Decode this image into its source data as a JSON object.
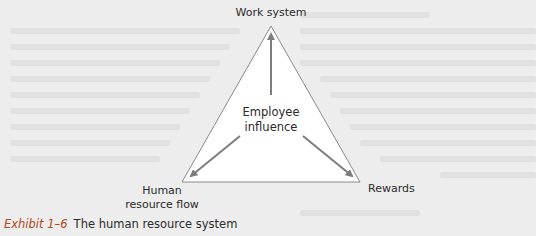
{
  "diagram": {
    "type": "triangle-influence",
    "nodes": {
      "top": {
        "label": "Work system"
      },
      "center": {
        "line1": "Employee",
        "line2": "influence"
      },
      "bottom_left": {
        "line1": "Human",
        "line2": "resource flow"
      },
      "bottom_right": {
        "label": "Rewards"
      }
    },
    "edges": [
      {
        "from": "Employee influence",
        "to": "Work system"
      },
      {
        "from": "Employee influence",
        "to": "Human resource flow"
      },
      {
        "from": "Employee influence",
        "to": "Rewards"
      }
    ],
    "colors": {
      "triangle_fill": "#ffffff",
      "triangle_stroke": "#8a8a8a",
      "arrow": "#7d7d7d",
      "background": "#ededed",
      "exhibit_accent": "#b14a1e"
    }
  },
  "caption": {
    "exhibit": "Exhibit 1–6",
    "title": "The human resource system"
  }
}
